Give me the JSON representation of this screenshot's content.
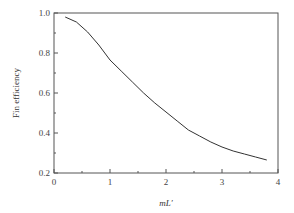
{
  "chart_data": {
    "type": "line",
    "title": "",
    "xlabel": "mL′",
    "ylabel": "Fin efficiency",
    "xlim": [
      0,
      4
    ],
    "ylim": [
      0.2,
      1.0
    ],
    "x_ticks": [
      0,
      1,
      2,
      3,
      4
    ],
    "x_tick_labels": [
      "0",
      "1",
      "2",
      "3",
      "4"
    ],
    "x_minor_step": 0.5,
    "y_ticks": [
      0.2,
      0.4,
      0.6,
      0.8,
      1.0
    ],
    "y_tick_labels": [
      "0.2",
      "0.4",
      "0.6",
      "0.8",
      "1.0"
    ],
    "y_minor_step": 0.1,
    "grid": false,
    "legend": "none",
    "series": [
      {
        "name": "Fin efficiency",
        "x": [
          0.2,
          0.4,
          0.6,
          0.8,
          1.0,
          1.2,
          1.4,
          1.6,
          1.8,
          2.0,
          2.2,
          2.4,
          2.6,
          2.8,
          3.0,
          3.2,
          3.4,
          3.6,
          3.8
        ],
        "y": [
          0.98,
          0.955,
          0.905,
          0.84,
          0.765,
          0.71,
          0.655,
          0.6,
          0.55,
          0.505,
          0.46,
          0.415,
          0.385,
          0.355,
          0.33,
          0.31,
          0.295,
          0.28,
          0.265
        ]
      }
    ]
  }
}
